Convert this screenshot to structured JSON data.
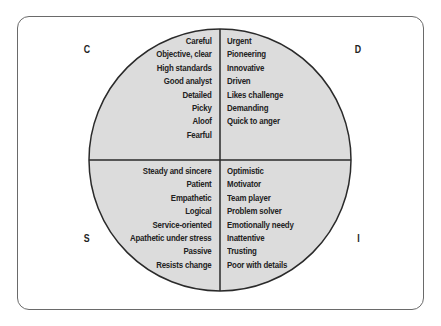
{
  "diagram": {
    "type": "quadrant-circle",
    "colors": {
      "fill": "#dcdcdc",
      "stroke": "#2a2a2a",
      "frame": "#6a6a6a"
    },
    "quadrants": {
      "C": {
        "label": "C",
        "traits": [
          "Careful",
          "Objective, clear",
          "High standards",
          "Good analyst",
          "Detailed",
          "Picky",
          "Aloof",
          "Fearful"
        ]
      },
      "D": {
        "label": "D",
        "traits": [
          "Urgent",
          "Pioneering",
          "Innovative",
          "Driven",
          "Likes challenge",
          "Demanding",
          "Quick to anger"
        ]
      },
      "S": {
        "label": "S",
        "traits": [
          "Steady and sincere",
          "Patient",
          "Empathetic",
          "Logical",
          "Service-oriented",
          "Apathetic under stress",
          "Passive",
          "Resists change"
        ]
      },
      "I": {
        "label": "I",
        "traits": [
          "Optimistic",
          "Motivator",
          "Team player",
          "Problem solver",
          "Emotionally needy",
          "Inattentive",
          "Trusting",
          "Poor with details"
        ]
      }
    }
  }
}
